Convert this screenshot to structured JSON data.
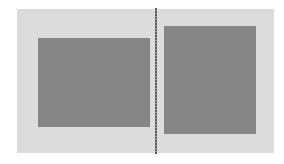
{
  "colors": {
    "background": "#ffffff",
    "panel": "#dcdcdc",
    "block": "#868686",
    "divider": "#5a5a5a"
  },
  "panels": [
    {
      "name": "left",
      "block": "gray rectangle"
    },
    {
      "name": "right",
      "block": "gray rectangle"
    }
  ]
}
